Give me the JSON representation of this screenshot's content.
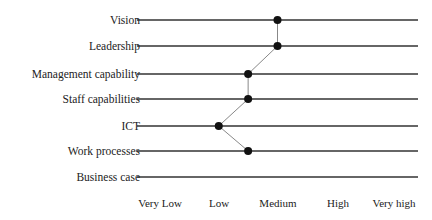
{
  "chart_data": {
    "type": "line",
    "orientation": "horizontal-profile",
    "title": "",
    "xlabel": "",
    "ylabel": "",
    "categories": [
      "Vision",
      "Leadership",
      "Management capability",
      "Staff capabilities",
      "ICT",
      "Work processes",
      "Business case"
    ],
    "scale_labels": [
      "Very Low",
      "Low",
      "Medium",
      "High",
      "Very high"
    ],
    "scale_values": [
      1,
      2,
      3,
      4,
      5
    ],
    "series": [
      {
        "name": "Assessment",
        "values": [
          3,
          3,
          2.5,
          2.5,
          2,
          2.5,
          null
        ]
      }
    ],
    "xlim": [
      0.6,
      5.4
    ],
    "grid": false,
    "legend": null,
    "colors": {
      "rule": "#333333",
      "marker": "#111111",
      "connector": "#888888"
    }
  },
  "labels": {
    "categories": [
      "Vision",
      "Leadership",
      "Management capability",
      "Staff capabilities",
      "ICT",
      "Work processes",
      "Business case"
    ],
    "ticks": [
      "Very Low",
      "Low",
      "Medium",
      "High",
      "Very high"
    ]
  }
}
